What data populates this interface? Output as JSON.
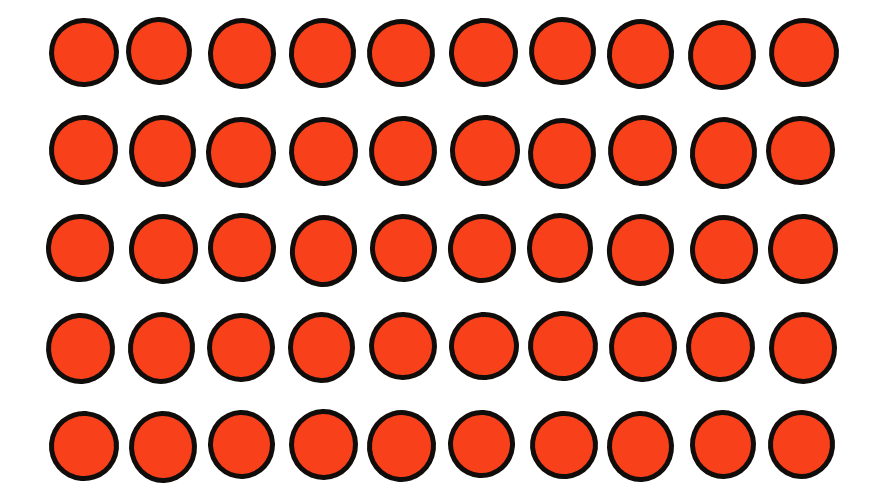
{
  "image": {
    "title": "Grid of filled circles",
    "background_color": "#ffffff",
    "width": 890,
    "height": 501
  },
  "shape": {
    "kind": "circle",
    "fill_color": "#f8401a",
    "outline_color": "#110d0b",
    "outline_width_px": 5,
    "diameter_px": 70
  },
  "grid": {
    "rows": 5,
    "columns": 10,
    "total_count": 50,
    "column_pitch_px": 80,
    "row_pitch_px": 98,
    "left_margin_px": 48,
    "top_margin_px": 18,
    "row_tops": [
      18,
      116,
      214,
      312,
      410
    ],
    "column_lefts": [
      48,
      128,
      208,
      288,
      368,
      448,
      528,
      608,
      688,
      768
    ],
    "cells": [
      [
        1,
        1,
        1,
        1,
        1,
        1,
        1,
        1,
        1,
        1
      ],
      [
        1,
        1,
        1,
        1,
        1,
        1,
        1,
        1,
        1,
        1
      ],
      [
        1,
        1,
        1,
        1,
        1,
        1,
        1,
        1,
        1,
        1
      ],
      [
        1,
        1,
        1,
        1,
        1,
        1,
        1,
        1,
        1,
        1
      ],
      [
        1,
        1,
        1,
        1,
        1,
        1,
        1,
        1,
        1,
        1
      ]
    ]
  }
}
